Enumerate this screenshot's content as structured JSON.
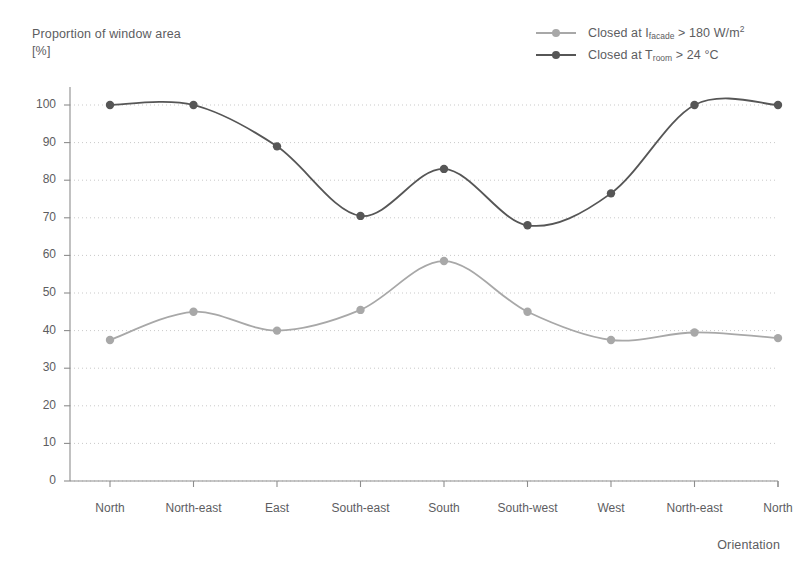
{
  "chart_data": {
    "type": "line",
    "title": "",
    "ylabel": "Proportion of window area\n[%]",
    "ylabel_line1": "Proportion of window area",
    "ylabel_line2": "[%]",
    "xlabel": "Orientation",
    "categories": [
      "North",
      "North-east",
      "East",
      "South-east",
      "South",
      "South-west",
      "West",
      "North-east",
      "North"
    ],
    "ylim": [
      0,
      100
    ],
    "yticks": [
      0,
      10,
      20,
      30,
      40,
      50,
      60,
      70,
      80,
      90,
      100
    ],
    "grid": "horizontal-dotted",
    "legend_position": "top-right",
    "series": [
      {
        "name": "Closed at I_facade > 180 W/m2",
        "label_prefix": "Closed at I",
        "label_sub": "facade",
        "label_suffix": " > 180 W/m",
        "label_sup": "2",
        "color": "#a8a8a8",
        "values": [
          37.5,
          45,
          40,
          45.5,
          58.5,
          45,
          37.5,
          39.5,
          38
        ]
      },
      {
        "name": "Closed at T_room > 24 degC",
        "label_prefix": "Closed at T",
        "label_sub": "room",
        "label_suffix": " > 24 °C",
        "label_sup": "",
        "color": "#565656",
        "values": [
          100,
          100,
          89,
          70.5,
          83,
          68,
          76.5,
          100,
          100
        ]
      }
    ]
  },
  "colors": {
    "axis": "#8d8d8d",
    "grid": "#c9c9c9",
    "text": "#5d5d5f",
    "series_light": "#a8a8a8",
    "series_dark": "#565656",
    "background": "#ffffff"
  }
}
